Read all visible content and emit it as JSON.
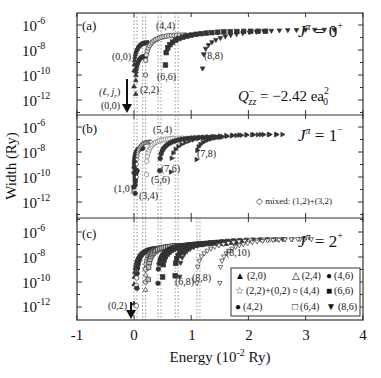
{
  "figure": {
    "ylabel": "Width (Ry)",
    "xlabel_main": "Energy (10",
    "xlabel_exp": "-2",
    "xlabel_unit": " Ry)",
    "xticks": [
      "-1",
      "0",
      "1",
      "2",
      "3",
      "4"
    ],
    "yticks": [
      "10",
      "10",
      "10",
      "10"
    ],
    "ytick_exps": [
      "-6",
      "-8",
      "-10",
      "-12"
    ]
  },
  "panels": [
    {
      "id": "a",
      "label": "(a)",
      "jpi": "J",
      "jpi_sup": "π",
      "jpi_val": " = 0",
      "jpi_parity": "+",
      "q_text": "Q",
      "q_sup": "−",
      "q_sub": "zz",
      "q_val": " = −2.42 ea",
      "q_val_sup": "2",
      "q_val_sub": "0",
      "arrow_label_top": "(ℓ, j",
      "arrow_label_top_sub": "r",
      "arrow_label_top_end": ")",
      "arrow_label_bottom": "(0,0)",
      "annotations": [
        "(0,0)",
        "(2,2)",
        "(4,4)",
        "(6,6)",
        "(8,8)"
      ]
    },
    {
      "id": "b",
      "label": "(b)",
      "jpi": "J",
      "jpi_sup": "π",
      "jpi_val": " = 1",
      "jpi_parity": "−",
      "mixed_note": "◇ mixed: (1,2)+(3,2)",
      "annotations": [
        "(1,0)",
        "(3,4)",
        "(5,4)",
        "(5,6)",
        "(7,6)",
        "(7,8)"
      ]
    },
    {
      "id": "c",
      "label": "(c)",
      "jpi": "J",
      "jpi_sup": "π",
      "jpi_val": " = 2",
      "jpi_parity": "+",
      "arrow_label": "(0,2)",
      "annotations": [
        "(6,8)",
        "(8,8)",
        "(8,10)"
      ],
      "legend": [
        {
          "marker": "▲",
          "label": "(2,0)"
        },
        {
          "marker": "△",
          "label": "(2,4)"
        },
        {
          "marker": "●",
          "label": "(4,6)"
        },
        {
          "marker": "☆",
          "label": "(2,2)+(0,2)"
        },
        {
          "marker": "○",
          "label": "(4,4)"
        },
        {
          "marker": "■",
          "label": "(6,6)"
        },
        {
          "marker": "●",
          "label": "(4,2)"
        },
        {
          "marker": "□",
          "label": "(6,4)"
        },
        {
          "marker": "▼",
          "label": "(8,6)"
        }
      ]
    }
  ],
  "chart_data": {
    "type": "scatter",
    "title": "",
    "xlabel": "Energy (10^-2 Ry)",
    "ylabel": "Width (Ry)",
    "xlim": [
      -1,
      4
    ],
    "ylim_log10": [
      -13.2,
      -5.1
    ],
    "yscale": "log",
    "grid": false,
    "panels": [
      {
        "panel": "(a)",
        "jpi": "0+",
        "annotation": "Q_zz^- = -2.42 e a_0^2",
        "thresholds_x": [
          0.0,
          0.15,
          0.42,
          0.72
        ],
        "series": [
          {
            "name": "(0,0)",
            "marker": "triangle-up-filled",
            "x0": 0.0,
            "x_end": 0.25,
            "logw_start": -10.9,
            "logw_end": -7.4
          },
          {
            "name": "(2,2)",
            "marker": "triangle-up-small",
            "x0": 0.03,
            "x_end": 0.2,
            "logw_start": -11.5,
            "logw_end": -8.5
          },
          {
            "name": "(4,4)",
            "marker": "circle-open",
            "x0": 0.2,
            "x_end": 0.9,
            "logw_start": -10.0,
            "logw_end": -6.8
          },
          {
            "name": "(6,6)",
            "marker": "square-filled",
            "x0": 0.55,
            "x_end": 2.3,
            "logw_start": -9.2,
            "logw_end": -6.5
          },
          {
            "name": "(8,8)",
            "marker": "triangle-down-filled",
            "x0": 1.2,
            "x_end": 3.5,
            "logw_start": -9.5,
            "logw_end": -6.4
          }
        ]
      },
      {
        "panel": "(b)",
        "jpi": "1-",
        "note": "mixed: (1,2)+(3,2)",
        "thresholds_x": [
          0.0,
          0.15,
          0.42,
          0.72
        ],
        "series": [
          {
            "name": "(1,0)",
            "marker": "circle-filled",
            "x0": 0.0,
            "x_end": 0.15,
            "logw_start": -10.8,
            "logw_end": -7.7
          },
          {
            "name": "(3,4)",
            "marker": "circle-filled",
            "x0": 0.02,
            "x_end": 0.05,
            "logw_start": -11.3,
            "logw_end": -9.5
          },
          {
            "name": "mixed (1,2)+(3,2)",
            "marker": "diamond-open",
            "x0": 0.05,
            "x_end": 0.3,
            "logw_start": -10.0,
            "logw_end": -7.2
          },
          {
            "name": "(5,4)",
            "marker": "circle-open-dot",
            "x0": 0.22,
            "x_end": 0.85,
            "logw_start": -9.8,
            "logw_end": -6.9
          },
          {
            "name": "(5,6)",
            "marker": "circle-filled",
            "x0": 0.45,
            "x_end": 1.5,
            "logw_start": -9.5,
            "logw_end": -6.8
          },
          {
            "name": "(7,6)",
            "marker": "triangle-right-filled",
            "x0": 0.65,
            "x_end": 2.5,
            "logw_start": -9.6,
            "logw_end": -6.6
          },
          {
            "name": "(7,8)",
            "marker": "triangle-right-filled",
            "x0": 1.1,
            "x_end": 2.6,
            "logw_start": -8.6,
            "logw_end": -6.6
          }
        ]
      },
      {
        "panel": "(c)",
        "jpi": "2+",
        "thresholds_x": [
          0.0,
          0.15,
          0.42,
          0.72,
          1.1
        ],
        "series": [
          {
            "name": "(2,0)",
            "marker": "triangle-up-filled",
            "x0": 0.0,
            "x_end": 0.3,
            "logw_start": -11.7,
            "logw_end": -7.5
          },
          {
            "name": "(2,2)+(0,2)",
            "marker": "star",
            "x0": 0.04,
            "x_end": 0.3,
            "logw_start": -11.9,
            "logw_end": -7.5
          },
          {
            "name": "(4,2)",
            "marker": "circle-filled",
            "x0": 0.05,
            "x_end": 0.5,
            "logw_start": -10.5,
            "logw_end": -7.3
          },
          {
            "name": "(2,4)",
            "marker": "triangle-up-open",
            "x0": 0.2,
            "x_end": 0.6,
            "logw_start": -10.6,
            "logw_end": -7.3
          },
          {
            "name": "(4,4)",
            "marker": "circle-open",
            "x0": 0.2,
            "x_end": 0.7,
            "logw_start": -10.0,
            "logw_end": -7.2
          },
          {
            "name": "(6,4)",
            "marker": "square-open",
            "x0": 0.25,
            "x_end": 0.9,
            "logw_start": -9.8,
            "logw_end": -7.1
          },
          {
            "name": "(4,6)",
            "marker": "circle-filled",
            "x0": 0.42,
            "x_end": 1.2,
            "logw_start": -10.1,
            "logw_end": -7.0
          },
          {
            "name": "(6,6)",
            "marker": "square-filled",
            "x0": 0.5,
            "x_end": 1.6,
            "logw_start": -9.6,
            "logw_end": -6.9
          },
          {
            "name": "(6,8)",
            "marker": "square-filled",
            "x0": 0.72,
            "x_end": 1.9,
            "logw_start": -9.5,
            "logw_end": -6.8
          },
          {
            "name": "(8,6)",
            "marker": "triangle-down-filled",
            "x0": 0.8,
            "x_end": 2.6,
            "logw_start": -9.6,
            "logw_end": -6.6
          },
          {
            "name": "(8,8)",
            "marker": "triangle-down-open",
            "x0": 1.1,
            "x_end": 2.9,
            "logw_start": -10.1,
            "logw_end": -6.6
          },
          {
            "name": "(8,10)",
            "marker": "triangle-down-open",
            "x0": 1.5,
            "x_end": 3.1,
            "logw_start": -10.1,
            "logw_end": -6.6
          }
        ]
      }
    ]
  }
}
